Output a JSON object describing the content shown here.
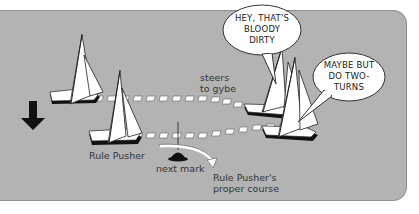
{
  "diagram": {
    "background_color": "#b3b3b3",
    "labels": {
      "steers_to_gybe_line1": "steers",
      "steers_to_gybe_line2": "to gybe",
      "rule_pusher": "Rule Pusher",
      "next_mark": "next mark",
      "proper_course_line1": "Rule Pusher's",
      "proper_course_line2": "proper course"
    },
    "speech_bubbles": [
      {
        "lines": [
          "HEY, THAT'S",
          "BLOODY",
          "DIRTY"
        ]
      },
      {
        "lines": [
          "MAYBE BUT",
          "DO TWO-",
          "TURNS"
        ]
      }
    ],
    "icons": {
      "direction_arrow": "down-arrow",
      "mark": "buoy-mark",
      "boats": [
        "sailboat-top-left",
        "sailboat-rule-pusher",
        "sailboat-right-upper",
        "sailboat-right-lower"
      ]
    }
  }
}
